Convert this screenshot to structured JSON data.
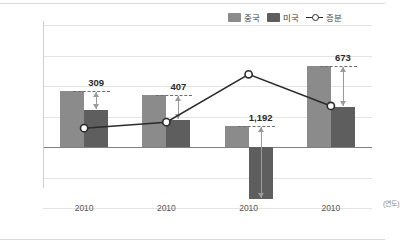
{
  "legend": {
    "position": "top-right",
    "items": [
      {
        "key": "china",
        "label": "중국",
        "color": "#8b8b8b",
        "type": "bar"
      },
      {
        "key": "usa",
        "label": "미국",
        "color": "#5e5e5e",
        "type": "bar"
      },
      {
        "key": "increment",
        "label": "증분",
        "color": "#2b2b2b",
        "type": "line"
      }
    ]
  },
  "axis": {
    "x_unit": "(연도)",
    "x_ticks": [
      "2010",
      "2010",
      "2010",
      "2010"
    ],
    "y_ticks": [
      "2,000",
      "1,500",
      "1,000",
      "500",
      "0",
      "-500",
      "-1,000"
    ],
    "y_min": -1000,
    "y_max": 2000,
    "y_step": 500
  },
  "labels": {
    "delta": [
      "309",
      "407",
      "1,192",
      "673"
    ]
  },
  "chart_data": {
    "type": "bar",
    "title": "",
    "subtitle": "",
    "xlabel": "(연도)",
    "ylabel": "",
    "categories": [
      "2010",
      "2010",
      "2010",
      "2010"
    ],
    "ylim": [
      -1000,
      2000
    ],
    "ystep": 500,
    "grid": true,
    "legend_position": "top-right",
    "series": [
      {
        "name": "중국",
        "type": "bar",
        "color": "#8b8b8b",
        "values": [
          920,
          850,
          340,
          1330
        ]
      },
      {
        "name": "미국",
        "type": "bar",
        "color": "#5e5e5e",
        "values": [
          611,
          443,
          -852,
          657
        ]
      },
      {
        "name": "증분",
        "type": "line",
        "color": "#2b2b2b",
        "values": [
          309,
          407,
          1192,
          673
        ]
      }
    ],
    "annotations": [
      {
        "text": "309",
        "value": 309,
        "category_index": 0,
        "style": "double-arrow"
      },
      {
        "text": "407",
        "value": 407,
        "category_index": 1,
        "style": "double-arrow"
      },
      {
        "text": "1,192",
        "value": 1192,
        "category_index": 2,
        "style": "double-arrow"
      },
      {
        "text": "673",
        "value": 673,
        "category_index": 3,
        "style": "double-arrow"
      }
    ]
  }
}
